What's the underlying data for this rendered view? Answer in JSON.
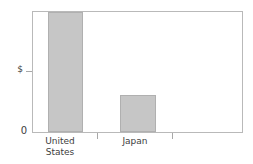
{
  "chart_data": {
    "type": "bar",
    "title": "",
    "xlabel": "",
    "ylabel": "$",
    "categories": [
      "United States",
      "Japan"
    ],
    "category_labels_wrapped": [
      "United\nStates",
      "Japan"
    ],
    "values": [
      100,
      31
    ],
    "ylim": [
      0,
      100
    ],
    "y_tick_labels": [
      "0"
    ],
    "y_axis_unit_label": "$",
    "grid": false,
    "legend": null,
    "bar_color": "#c6c6c6",
    "bar_border_color": "#b0b0b0",
    "frame_color": "#b9b9b9",
    "axis_text_color": "#3d3d3d",
    "series": [
      {
        "name": "",
        "values": [
          100,
          31
        ]
      }
    ],
    "annotations": []
  },
  "axes": {
    "y": {
      "zero_label": "0",
      "unit_symbol": "$"
    }
  }
}
